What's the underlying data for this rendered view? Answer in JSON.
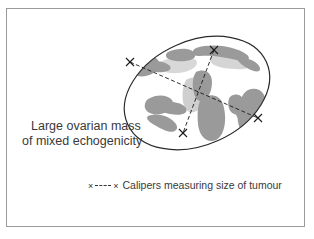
{
  "figure": {
    "cropped_title": "ovarian mass",
    "annotations": {
      "mass_label_line1": "Large ovarian mass",
      "mass_label_line2": "of mixed echogenicity"
    },
    "legend": {
      "marker_left": "×",
      "marker_right": "×",
      "dash_style": "dashed",
      "label": "Calipers measuring size of tumour"
    },
    "colors": {
      "frame_border": "#9a9a9a",
      "background": "#ffffff",
      "ellipse_stroke": "#2b2b2b",
      "echogenic_blob": "#9a9a9a",
      "echogenic_blob_light": "#c9c9c9",
      "caliper_line": "#1a1a1a",
      "text": "#3a3a3a"
    },
    "calipers": [
      {
        "name": "long-axis",
        "from": [
          130,
          62
        ],
        "to": [
          258,
          118
        ]
      },
      {
        "name": "short-axis",
        "from": [
          214,
          50
        ],
        "to": [
          183,
          133
        ]
      }
    ],
    "ellipse": {
      "center_x": 197,
      "center_y": 93,
      "radius_x": 76,
      "radius_y": 52,
      "rotation_deg": -24
    }
  }
}
